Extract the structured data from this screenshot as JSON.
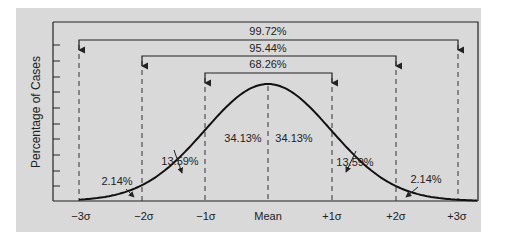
{
  "chart_data": {
    "type": "line",
    "title": "",
    "xlabel": "",
    "ylabel": "Percentage of Cases",
    "x_ticks": [
      "−3σ",
      "−2σ",
      "−1σ",
      "Mean",
      "+1σ",
      "+2σ",
      "+3σ"
    ],
    "x_values": [
      -3,
      -2,
      -1,
      0,
      1,
      2,
      3
    ],
    "series": [
      {
        "name": "Normal distribution",
        "description": "Standard normal bell curve"
      }
    ],
    "grid": false,
    "legend": null,
    "y_ticks_count": 9,
    "region_labels": [
      {
        "range": [
          -3,
          -2
        ],
        "label": "2.14%"
      },
      {
        "range": [
          -2,
          -1
        ],
        "label": "13.59%"
      },
      {
        "range": [
          -1,
          0
        ],
        "label": "34.13%"
      },
      {
        "range": [
          0,
          1
        ],
        "label": "34.13%"
      },
      {
        "range": [
          1,
          2
        ],
        "label": "13.59%"
      },
      {
        "range": [
          2,
          3
        ],
        "label": "2.14%"
      }
    ],
    "brackets": [
      {
        "range": [
          -3,
          3
        ],
        "label": "99.72%"
      },
      {
        "range": [
          -2,
          2
        ],
        "label": "95.44%"
      },
      {
        "range": [
          -1,
          1
        ],
        "label": "68.26%"
      }
    ]
  },
  "labels": {
    "ylabel": "Percentage of Cases",
    "bracket_3sd": "99.72%",
    "bracket_2sd": "95.44%",
    "bracket_1sd": "68.26%",
    "region_m1_0": "34.13%",
    "region_0_p1": "34.13%",
    "region_m2_m1": "13.59%",
    "region_p1_p2": "13.59%",
    "region_m3_m2": "2.14%",
    "region_p2_p3": "2.14%",
    "tick_m3": "−3σ",
    "tick_m2": "−2σ",
    "tick_m1": "−1σ",
    "tick_mean": "Mean",
    "tick_p1": "+1σ",
    "tick_p2": "+2σ",
    "tick_p3": "+3σ"
  },
  "colors": {
    "panel": "#d9d9d9",
    "ink": "#222222",
    "background": "#ffffff"
  }
}
